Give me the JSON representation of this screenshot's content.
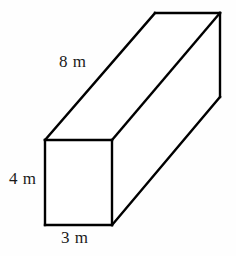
{
  "figure": {
    "name": "rectangular-prism",
    "stroke_color": "#000000",
    "fill_color": "#ffffff",
    "background_color": "#fefefe",
    "labels": {
      "length": "8 m",
      "height": "4 m",
      "width": "3 m"
    },
    "dimensions": [
      {
        "edge": "length",
        "value": 8,
        "unit": "m",
        "text": "8 m"
      },
      {
        "edge": "height",
        "value": 4,
        "unit": "m",
        "text": "4 m"
      },
      {
        "edge": "width",
        "value": 3,
        "unit": "m",
        "text": "3 m"
      }
    ],
    "geometry": {
      "front_face": {
        "x1": 45,
        "y1": 140,
        "x2": 112,
        "y2": 225
      },
      "depth_offset": {
        "dx": 108,
        "dy": -127
      },
      "vertices": {
        "front_top_left": [
          45,
          140
        ],
        "front_top_right": [
          112,
          140
        ],
        "front_bottom_left": [
          45,
          225
        ],
        "front_bottom_right": [
          112,
          225
        ],
        "back_top_left": [
          155,
          13
        ],
        "back_top_right": [
          220,
          13
        ],
        "back_bottom_right": [
          220,
          97
        ]
      }
    }
  }
}
